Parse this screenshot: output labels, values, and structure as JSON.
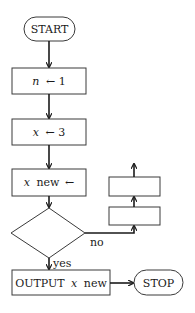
{
  "flowchart": {
    "start": {
      "label": "START"
    },
    "step1": {
      "var": "n",
      "arrow": "←",
      "value": "1"
    },
    "step2": {
      "var": "x",
      "arrow": "←",
      "value": "3"
    },
    "step3": {
      "var": "x",
      "suffix": "new",
      "arrow": "←"
    },
    "decision": {
      "label": ""
    },
    "branch_no": {
      "label": "no"
    },
    "branch_yes": {
      "label": "yes"
    },
    "side_box_lower": {
      "label": ""
    },
    "side_box_upper": {
      "label": ""
    },
    "output": {
      "prefix": "OUTPUT",
      "var": "x",
      "suffix": "new"
    },
    "stop": {
      "label": "STOP"
    }
  },
  "colors": {
    "stroke": "#3a3a3a",
    "line": "#1a1a1a",
    "background": "#ffffff"
  }
}
